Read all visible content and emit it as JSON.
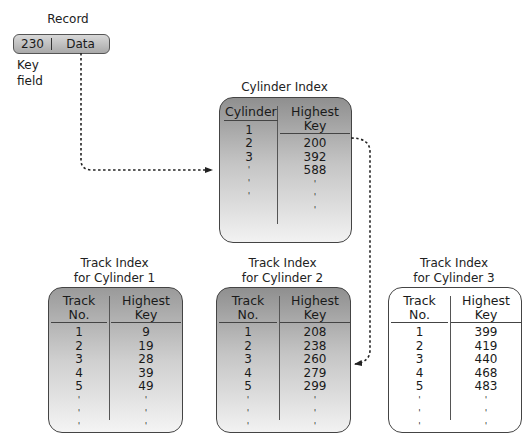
{
  "record": {
    "title": "Record",
    "key": "230",
    "data": "Data",
    "key_field_label_1": "Key",
    "key_field_label_2": "field"
  },
  "cylinder_index": {
    "title": "Cylinder Index",
    "headers": [
      "Cylinder",
      "Highest Key"
    ],
    "rows": [
      [
        "1",
        "200"
      ],
      [
        "2",
        "392"
      ],
      [
        "3",
        "588"
      ]
    ],
    "ellipsis": "'"
  },
  "track_indexes": [
    {
      "title_1": "Track Index",
      "title_2": "for Cylinder 1",
      "headers": [
        "Track No.",
        "Highest Key"
      ],
      "rows": [
        [
          "1",
          "9"
        ],
        [
          "2",
          "19"
        ],
        [
          "3",
          "28"
        ],
        [
          "4",
          "39"
        ],
        [
          "5",
          "49"
        ]
      ]
    },
    {
      "title_1": "Track Index",
      "title_2": "for Cylinder 2",
      "headers": [
        "Track No.",
        "Highest Key"
      ],
      "rows": [
        [
          "1",
          "208"
        ],
        [
          "2",
          "238"
        ],
        [
          "3",
          "260"
        ],
        [
          "4",
          "279"
        ],
        [
          "5",
          "299"
        ]
      ]
    },
    {
      "title_1": "Track Index",
      "title_2": "for Cylinder 3",
      "headers": [
        "Track No.",
        "Highest Key"
      ],
      "rows": [
        [
          "1",
          "399"
        ],
        [
          "2",
          "419"
        ],
        [
          "3",
          "440"
        ],
        [
          "4",
          "468"
        ],
        [
          "5",
          "483"
        ]
      ]
    }
  ],
  "colors": {
    "box_border": "#444444",
    "dark_gradient_top": "#8f8f8f",
    "light_fill": "#ffffff",
    "arrow": "#222222"
  }
}
